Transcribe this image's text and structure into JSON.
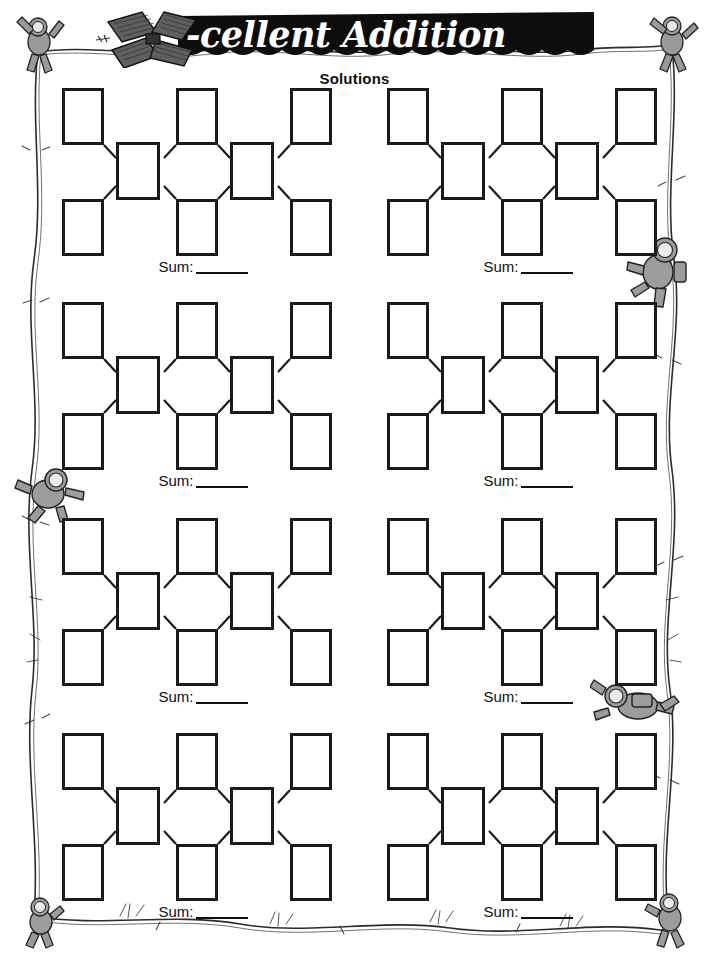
{
  "page": {
    "width": 709,
    "height": 958,
    "background": "#ffffff",
    "ink": "#1a1a1a"
  },
  "header": {
    "title": "-cellent Addition",
    "title_full": "X-cellent Addition",
    "subtitle": "Solutions",
    "banner_color": "#0d0d0d",
    "title_color": "#ffffff",
    "logo_icon": "satellite-icon"
  },
  "worksheet": {
    "puzzle_count": 8,
    "columns": 2,
    "rows": 4,
    "boxes_per_puzzle": 8,
    "top_row_boxes": 3,
    "middle_row_boxes": 2,
    "bottom_row_boxes": 3,
    "sum_label": "Sum:",
    "sum_value": "",
    "box_value": "",
    "puzzles": [
      {
        "id": "puzzle-1",
        "position": "row-1-left",
        "sum_label": "Sum:",
        "sum_value": "",
        "cells": {
          "top": [
            "",
            "",
            ""
          ],
          "middle": [
            "",
            ""
          ],
          "bottom": [
            "",
            ""
          ]
        }
      },
      {
        "id": "puzzle-2",
        "position": "row-1-right",
        "sum_label": "Sum:",
        "sum_value": "",
        "cells": {
          "top": [
            "",
            "",
            ""
          ],
          "middle": [
            "",
            ""
          ],
          "bottom": [
            "",
            ""
          ]
        }
      },
      {
        "id": "puzzle-3",
        "position": "row-2-left",
        "sum_label": "Sum:",
        "sum_value": "",
        "cells": {
          "top": [
            "",
            "",
            ""
          ],
          "middle": [
            "",
            ""
          ],
          "bottom": [
            "",
            ""
          ]
        }
      },
      {
        "id": "puzzle-4",
        "position": "row-2-right",
        "sum_label": "Sum:",
        "sum_value": "",
        "cells": {
          "top": [
            "",
            "",
            ""
          ],
          "middle": [
            "",
            ""
          ],
          "bottom": [
            "",
            ""
          ]
        }
      },
      {
        "id": "puzzle-5",
        "position": "row-3-left",
        "sum_label": "Sum:",
        "sum_value": "",
        "cells": {
          "top": [
            "",
            "",
            ""
          ],
          "middle": [
            "",
            ""
          ],
          "bottom": [
            "",
            ""
          ]
        }
      },
      {
        "id": "puzzle-6",
        "position": "row-3-right",
        "sum_label": "Sum:",
        "sum_value": "",
        "cells": {
          "top": [
            "",
            "",
            ""
          ],
          "middle": [
            "",
            ""
          ],
          "bottom": [
            "",
            ""
          ]
        }
      },
      {
        "id": "puzzle-7",
        "position": "row-4-left",
        "sum_label": "Sum:",
        "sum_value": "",
        "cells": {
          "top": [
            "",
            "",
            ""
          ],
          "middle": [
            "",
            ""
          ],
          "bottom": [
            "",
            ""
          ]
        }
      },
      {
        "id": "puzzle-8",
        "position": "row-4-right",
        "sum_label": "Sum:",
        "sum_value": "",
        "cells": {
          "top": [
            "",
            "",
            ""
          ],
          "middle": [
            "",
            ""
          ],
          "bottom": [
            "",
            ""
          ]
        }
      }
    ]
  },
  "decorations": {
    "border_style": "hand-drawn-rope",
    "astronauts": [
      {
        "name": "astronaut-top-left",
        "x": 14,
        "y": 18,
        "w": 52,
        "h": 62,
        "pose": "climbing-up"
      },
      {
        "name": "astronaut-top-right",
        "x": 648,
        "y": 18,
        "w": 50,
        "h": 58,
        "pose": "climbing-up"
      },
      {
        "name": "astronaut-right-upper",
        "x": 622,
        "y": 232,
        "w": 72,
        "h": 72,
        "pose": "climbing-rope"
      },
      {
        "name": "astronaut-left-middle",
        "x": 18,
        "y": 462,
        "w": 64,
        "h": 60,
        "pose": "floating"
      },
      {
        "name": "astronaut-right-lower",
        "x": 596,
        "y": 678,
        "w": 84,
        "h": 58,
        "pose": "floating-horizontal"
      },
      {
        "name": "astronaut-bottom-left",
        "x": 20,
        "y": 898,
        "w": 40,
        "h": 50,
        "pose": "hanging"
      },
      {
        "name": "astronaut-bottom-right",
        "x": 648,
        "y": 896,
        "w": 44,
        "h": 52,
        "pose": "hanging"
      }
    ]
  }
}
